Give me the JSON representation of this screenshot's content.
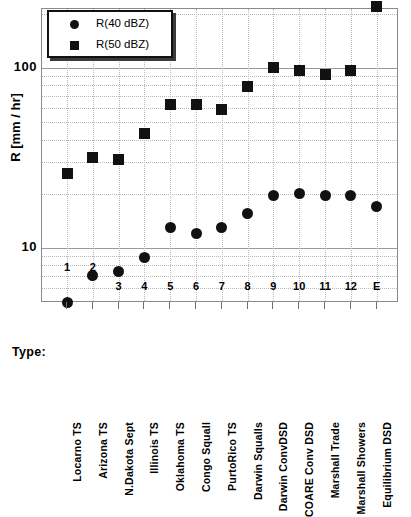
{
  "chart_data": {
    "type": "scatter",
    "title": "",
    "xlabel": "Type:",
    "ylabel": "R [mm / hr]",
    "yscale": "log",
    "ylim": [
      4.0,
      300
    ],
    "grid": true,
    "legend_position": "top-left",
    "ytick_labels": [
      "100",
      "10"
    ],
    "ytick_values": [
      100,
      10
    ],
    "index_labels": [
      "1",
      "2",
      "3",
      "4",
      "5",
      "6",
      "7",
      "8",
      "9",
      "10",
      "11",
      "12",
      "E"
    ],
    "categories": [
      "Locarno TS",
      "Arizona TS",
      "N.Dakota Sept",
      "Illinois TS",
      "Oklahoma TS",
      "Congo Squall",
      "PurtoRico TS",
      "Darwin Squalls",
      "Darwin ConvDSD",
      "COARE Conv DSD",
      "Marshall Trade",
      "Marshall Showers",
      "Equilibrium DSD"
    ],
    "series": [
      {
        "name": "R(40 dBZ)",
        "marker": "circle",
        "color": "#111111",
        "values": [
          5.0,
          7.0,
          7.4,
          8.9,
          13.0,
          12.0,
          13.0,
          15.5,
          19.5,
          20.0,
          19.5,
          19.5,
          17.0
        ]
      },
      {
        "name": "R(50 dBZ)",
        "marker": "square",
        "color": "#111111",
        "values": [
          26.0,
          32.0,
          31.0,
          43.0,
          63.0,
          63.0,
          59.0,
          79.0,
          101.0,
          97.0,
          92.0,
          97.0,
          220.0
        ]
      }
    ]
  },
  "legend": {
    "entries": [
      {
        "label": "R(40 dBZ)",
        "marker": "circle"
      },
      {
        "label": "R(50 dBZ)",
        "marker": "square"
      }
    ]
  },
  "axis": {
    "y_title": "R [mm / hr]",
    "type_prefix": "Type:"
  }
}
